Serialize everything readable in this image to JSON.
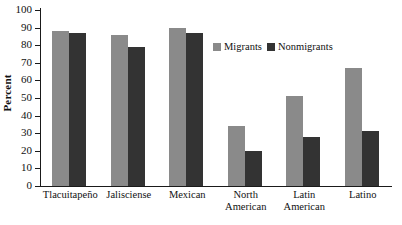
{
  "chart_data": {
    "type": "bar",
    "title": "",
    "xlabel": "",
    "ylabel": "Percent",
    "ylim": [
      0,
      100
    ],
    "ytick_step": 10,
    "yticks": [
      0,
      10,
      20,
      30,
      40,
      50,
      60,
      70,
      80,
      90,
      100
    ],
    "grid": false,
    "legend_position": "inside-upper-right",
    "categories": [
      "Tlacuitapeño",
      "Jalisciense",
      "Mexican",
      "North American",
      "Latin American",
      "Latino"
    ],
    "series": [
      {
        "name": "Migrants",
        "color": "#8a8a8a",
        "values": [
          88,
          86,
          90,
          34,
          51,
          67
        ]
      },
      {
        "name": "Nonmigrants",
        "color": "#333333",
        "values": [
          87,
          79,
          87,
          20,
          28,
          31
        ]
      }
    ]
  },
  "axis": {
    "y_title": "Percent",
    "tick_labels": [
      "100",
      "90",
      "80",
      "70",
      "60",
      "50",
      "40",
      "30",
      "20",
      "10",
      "0"
    ]
  },
  "category_lines": [
    [
      "Tlacuitapeño"
    ],
    [
      "Jalisciense"
    ],
    [
      "Mexican"
    ],
    [
      "North",
      "American"
    ],
    [
      "Latin",
      "American"
    ],
    [
      "Latino"
    ]
  ],
  "legend": {
    "items": [
      {
        "label": "Migrants",
        "color": "#8a8a8a"
      },
      {
        "label": "Nonmigrants",
        "color": "#333333"
      }
    ]
  },
  "colors": {
    "migrants": "#8a8a8a",
    "nonmigrants": "#333333",
    "axis": "#1a1a1a",
    "text": "#111111",
    "background": "#ffffff"
  }
}
